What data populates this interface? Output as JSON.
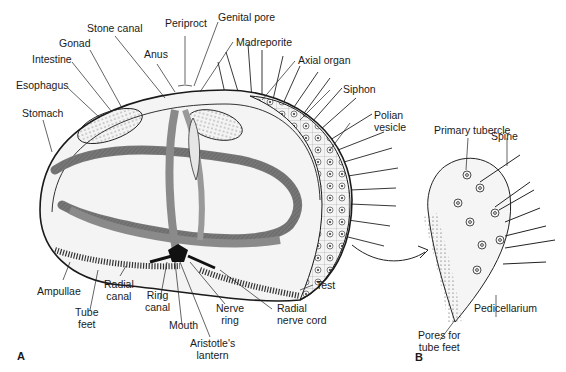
{
  "figure": {
    "panel_a_label": "A",
    "panel_b_label": "B"
  },
  "panel_a": {
    "labels": {
      "stone_canal": "Stone canal",
      "periproct": "Periproct",
      "genital_pore": "Genital pore",
      "gonad": "Gonad",
      "anus": "Anus",
      "madreporite": "Madreporite",
      "intestine": "Intestine",
      "axial_organ": "Axial organ",
      "esophagus": "Esophagus",
      "siphon": "Siphon",
      "stomach": "Stomach",
      "polian_vesicle_1": "Polian",
      "polian_vesicle_2": "vesicle",
      "test": "Test",
      "ampullae": "Ampullae",
      "radial_canal_1": "Radial",
      "radial_canal_2": "canal",
      "tube_feet_1": "Tube",
      "tube_feet_2": "feet",
      "ring_canal_1": "Ring",
      "ring_canal_2": "canal",
      "mouth": "Mouth",
      "nerve_ring_1": "Nerve",
      "nerve_ring_2": "ring",
      "aristotles_lantern_1": "Aristotle's",
      "aristotles_lantern_2": "lantern",
      "radial_nerve_cord_1": "Radial",
      "radial_nerve_cord_2": "nerve cord"
    }
  },
  "panel_b": {
    "labels": {
      "primary_tubercle": "Primary tubercle",
      "spine": "Spine",
      "pedicellarium": "Pedicellarium",
      "pores_1": "Pores for",
      "pores_2": "tube feet"
    }
  },
  "colors": {
    "ink": "#1a1a1a",
    "shade": "#8a8a8a",
    "light_shade": "#c8c8c8",
    "background": "#ffffff"
  }
}
